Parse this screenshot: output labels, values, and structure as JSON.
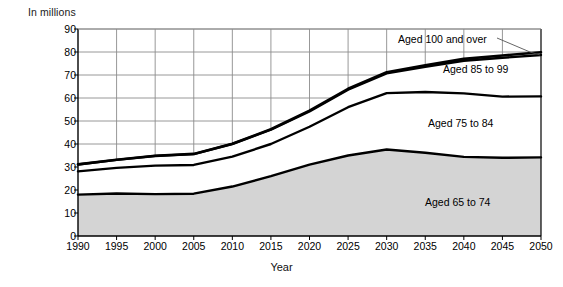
{
  "chart_data": {
    "type": "area",
    "title": "",
    "subtitle": "",
    "unit_label": "In millions",
    "xlabel": "Year",
    "ylabel": "",
    "x": [
      1990,
      1995,
      2000,
      2005,
      2010,
      2015,
      2020,
      2025,
      2030,
      2035,
      2040,
      2045,
      2050
    ],
    "xlim": [
      1990,
      2050
    ],
    "ylim": [
      0,
      90
    ],
    "xticks": [
      "1990",
      "1995",
      "2000",
      "2005",
      "2010",
      "2015",
      "2020",
      "2025",
      "2030",
      "2035",
      "2040",
      "2045",
      "2050"
    ],
    "yticks": [
      "0",
      "10",
      "20",
      "30",
      "40",
      "50",
      "60",
      "70",
      "80",
      "90"
    ],
    "grid": true,
    "legend_position": "inline-annotations",
    "stacked": true,
    "series": [
      {
        "name": "Aged 65 to 74",
        "label": "Aged 65 to 74",
        "fill": "#d4d4d4",
        "values": [
          18.0,
          18.5,
          18.2,
          18.4,
          21.5,
          26.0,
          31.0,
          35.0,
          37.6,
          36.2,
          34.4,
          34.0,
          34.2
        ]
      },
      {
        "name": "Aged 75 to 84",
        "label": "Aged 75 to 84",
        "fill": "#ffffff",
        "values": [
          10.1,
          11.1,
          12.4,
          12.5,
          13.0,
          14.0,
          16.5,
          21.0,
          24.5,
          26.4,
          27.6,
          26.6,
          26.5
        ]
      },
      {
        "name": "Aged 85 to 99",
        "label": "Aged 85 to 99",
        "fill": "#ffffff",
        "values": [
          3.0,
          3.5,
          4.2,
          4.7,
          5.5,
          6.2,
          6.7,
          7.6,
          8.6,
          11.0,
          14.2,
          16.9,
          18.0
        ]
      },
      {
        "name": "Aged 100 and over",
        "label": "Aged 100 and over",
        "fill": "#ffffff",
        "values": [
          0.04,
          0.06,
          0.08,
          0.1,
          0.13,
          0.2,
          0.3,
          0.4,
          0.5,
          0.6,
          0.8,
          1.0,
          1.2
        ]
      }
    ],
    "cumulative_totals": {
      "aged_65_plus_74": [
        18.0,
        18.5,
        18.2,
        18.4,
        21.5,
        26.0,
        31.0,
        35.0,
        37.6,
        36.2,
        34.4,
        34.0,
        34.2
      ],
      "through_84": [
        28.1,
        29.6,
        30.6,
        30.9,
        34.5,
        40.0,
        47.5,
        56.0,
        62.1,
        62.6,
        62.0,
        60.6,
        60.7
      ],
      "through_99": [
        31.1,
        33.1,
        34.8,
        35.6,
        40.0,
        46.2,
        54.2,
        63.6,
        70.7,
        73.6,
        76.2,
        77.5,
        78.7
      ],
      "through_100_plus": [
        31.2,
        33.2,
        34.9,
        35.7,
        40.1,
        46.4,
        54.5,
        64.0,
        71.2,
        74.2,
        77.0,
        78.5,
        79.9
      ]
    },
    "annotations": [
      {
        "text": "Aged 100 and over",
        "leader_line": true,
        "points_to_year": 2050
      },
      {
        "text": "Aged 85 to 99",
        "leader_line": false
      },
      {
        "text": "Aged 75 to 84",
        "leader_line": false
      },
      {
        "text": "Aged 65 to 74",
        "leader_line": false
      }
    ]
  },
  "colors": {
    "grid": "#8c8c8c",
    "axis": "#000000",
    "curve": "#000000",
    "area_fill": "#d4d4d4",
    "background": "#ffffff"
  },
  "caption": {
    "clipped_text": ""
  }
}
